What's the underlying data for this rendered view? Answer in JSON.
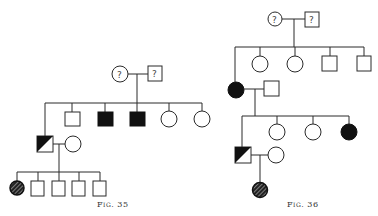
{
  "figures": [
    {
      "id": "fig35",
      "caption": "Fig. 35",
      "generations": [
        {
          "label": "parents",
          "members": [
            {
              "sex": "female",
              "status": "unknown",
              "mark": "?"
            },
            {
              "sex": "male",
              "status": "unknown",
              "mark": "?"
            }
          ]
        },
        {
          "label": "children",
          "members": [
            {
              "sex": "male",
              "status": "carrier-half-affected"
            },
            {
              "sex": "male",
              "status": "unaffected"
            },
            {
              "sex": "male",
              "status": "affected"
            },
            {
              "sex": "male",
              "status": "affected"
            },
            {
              "sex": "female",
              "status": "unaffected"
            },
            {
              "sex": "female",
              "status": "unaffected"
            }
          ],
          "spouse_of_first": {
            "sex": "female",
            "status": "unaffected"
          }
        },
        {
          "label": "grandchildren",
          "members": [
            {
              "sex": "female",
              "status": "hatched-affected"
            },
            {
              "sex": "male",
              "status": "unaffected"
            },
            {
              "sex": "male",
              "status": "unaffected"
            },
            {
              "sex": "male",
              "status": "unaffected"
            },
            {
              "sex": "male",
              "status": "unaffected"
            }
          ]
        }
      ]
    },
    {
      "id": "fig36",
      "caption": "Fig. 36",
      "generations": [
        {
          "label": "parents",
          "members": [
            {
              "sex": "female",
              "status": "unknown",
              "mark": "?"
            },
            {
              "sex": "male",
              "status": "unknown",
              "mark": "?"
            }
          ]
        },
        {
          "label": "children",
          "members": [
            {
              "sex": "female",
              "status": "affected"
            },
            {
              "sex": "female",
              "status": "unaffected"
            },
            {
              "sex": "female",
              "status": "unaffected"
            },
            {
              "sex": "male",
              "status": "unaffected"
            },
            {
              "sex": "male",
              "status": "unaffected"
            }
          ],
          "spouse_of_first": {
            "sex": "male",
            "status": "unaffected"
          }
        },
        {
          "label": "grandchildren",
          "members": [
            {
              "sex": "male",
              "status": "carrier-half-affected"
            },
            {
              "sex": "female",
              "status": "unaffected"
            },
            {
              "sex": "female",
              "status": "unaffected"
            },
            {
              "sex": "female",
              "status": "affected"
            }
          ],
          "spouse_of_first": {
            "sex": "female",
            "status": "unaffected"
          }
        },
        {
          "label": "great-grandchildren",
          "members": [
            {
              "sex": "female",
              "status": "hatched-affected"
            }
          ]
        }
      ]
    }
  ],
  "symbols": {
    "unknown_mark": "?"
  },
  "colors": {
    "line": "#2a2a2a",
    "fill": "#111111",
    "background": "#ffffff"
  }
}
